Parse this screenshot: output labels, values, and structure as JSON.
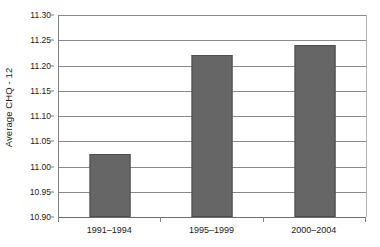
{
  "chart_data": {
    "type": "bar",
    "title": "",
    "xlabel": "",
    "ylabel": "Average CHQ - 12",
    "categories": [
      "1991–1994",
      "1995–1999",
      "2000–2004"
    ],
    "values": [
      11.025,
      11.22,
      11.24
    ],
    "ylim": [
      10.9,
      11.3
    ],
    "ytick_labels": [
      "11.30",
      "11.25",
      "11.20",
      "11.15",
      "11.10",
      "11.05",
      "11.00",
      "10.95",
      "10.90"
    ],
    "ytick_values": [
      11.3,
      11.25,
      11.2,
      11.15,
      11.1,
      11.05,
      11.0,
      10.95,
      10.9
    ],
    "grid": true,
    "legend": "none",
    "series": [
      {
        "name": "Average CHQ - 12",
        "values": [
          11.025,
          11.22,
          11.24
        ]
      }
    ],
    "colors": {
      "bar_fill": "#666666",
      "bar_border": "#4d4d4d",
      "gridline": "#8a8a8a",
      "axis": "#808080",
      "background": "#ffffff",
      "text": "#1a1a1a"
    }
  }
}
